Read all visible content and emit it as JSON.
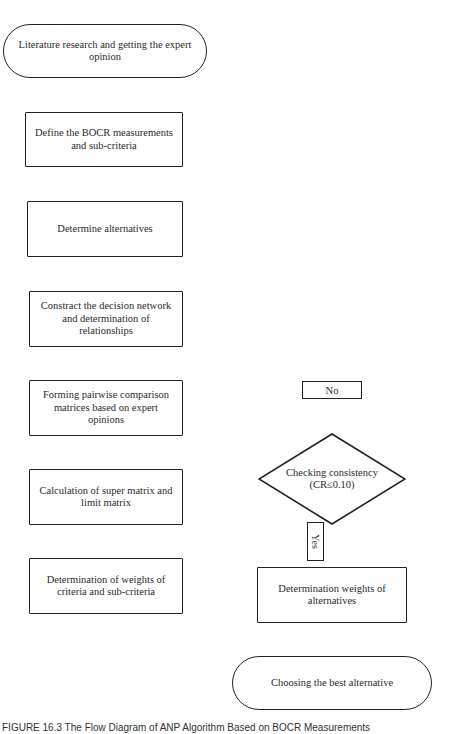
{
  "diagram": {
    "start": {
      "label": "Literature research and  getting the expert opinion"
    },
    "steps": [
      {
        "label": "Define the BOCR measurements and sub-criteria"
      },
      {
        "label": "Determine alternatives"
      },
      {
        "label": "Constract the  decision network and determination of relationships"
      },
      {
        "label": "Forming pairwise comparison matrices based on expert opinions"
      },
      {
        "label": "Calculation of super matrix and limit matrix"
      },
      {
        "label": "Determination of weights of criteria and sub-criteria"
      }
    ],
    "decision": {
      "line1": "Checking consistency",
      "line2": "(CR≤0.10)"
    },
    "no_label": "No",
    "yes_label": "Yes",
    "alt_weights": {
      "label": "Determination weights of alternatives"
    },
    "end": {
      "label": "Choosing the best alternative"
    }
  },
  "caption": "FIGURE 16.3  The Flow Diagram of ANP Algorithm Based on BOCR Measurements"
}
